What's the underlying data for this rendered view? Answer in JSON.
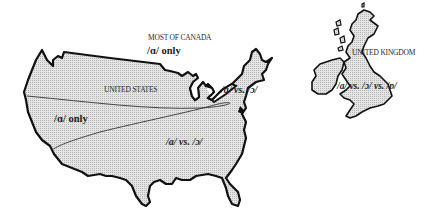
{
  "colors": {
    "land_fill": "#d6d6d6",
    "outline": "#111111",
    "background": "#ffffff",
    "text": "#1e1e1e"
  },
  "regions": {
    "canada": {
      "name": "MOST OF CANADA",
      "value": "/ɑ/ only"
    },
    "us": {
      "name": "UNITED STATES",
      "west_value": "/ɑ/ only",
      "south_value": "/ɑ/ vs. /ɔ/",
      "northeast_value": "/ɑ/ vs. /ɔ/"
    },
    "uk": {
      "name": "UNITED KINGDOM",
      "value": "/ɑ/ vs. /ɔ/ vs. /ɒ/"
    }
  }
}
